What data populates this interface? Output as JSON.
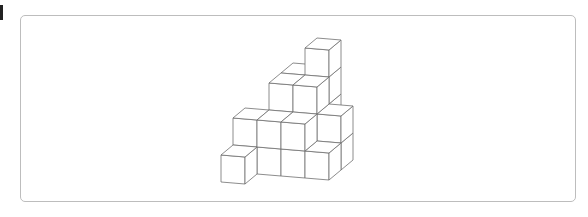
{
  "page": {
    "marker_color": "#222222",
    "frame_border_color": "#bdbdbd",
    "line_color": "#6e6e6e"
  },
  "figure": {
    "type": "isometric-cube-stack",
    "projection": {
      "origin": [
        221,
        182
      ],
      "x_axis": [
        24,
        2
      ],
      "y_axis": [
        12,
        -10
      ],
      "z_axis": [
        0,
        -27
      ]
    },
    "cubes": [
      [
        0,
        0,
        0
      ],
      [
        0,
        1,
        0
      ],
      [
        0,
        1,
        1
      ],
      [
        1,
        1,
        0
      ],
      [
        1,
        1,
        1
      ],
      [
        2,
        1,
        0
      ],
      [
        2,
        1,
        1
      ],
      [
        3,
        1,
        0
      ],
      [
        1,
        2,
        0
      ],
      [
        1,
        2,
        1
      ],
      [
        1,
        2,
        2
      ],
      [
        2,
        2,
        0
      ],
      [
        2,
        2,
        1
      ],
      [
        2,
        2,
        2
      ],
      [
        3,
        2,
        0
      ],
      [
        3,
        2,
        1
      ],
      [
        1,
        3,
        0
      ],
      [
        1,
        3,
        1
      ],
      [
        1,
        3,
        2
      ],
      [
        2,
        3,
        0
      ],
      [
        2,
        3,
        1
      ],
      [
        2,
        3,
        2
      ],
      [
        2,
        3,
        3
      ]
    ]
  }
}
